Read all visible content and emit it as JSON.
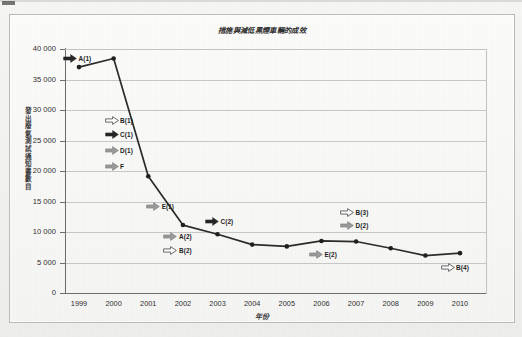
{
  "figure": {
    "title": "措施與減低黑煙車輛的成效",
    "x_axis_title": "年份",
    "y_axis_title": "發出廢氣測試通知書數目"
  },
  "chart_data": {
    "type": "line",
    "title": "措施與減低黑煙車輛的成效",
    "xlabel": "年份",
    "ylabel": "發出廢氣測試通知書數目",
    "xlim": [
      1999,
      2010
    ],
    "ylim": [
      0,
      40000
    ],
    "y_tick_step": 5000,
    "grid": true,
    "legend": "none",
    "categories": [
      "1999",
      "2000",
      "2001",
      "2002",
      "2003",
      "2004",
      "2005",
      "2006",
      "2007",
      "2008",
      "2009",
      "2010"
    ],
    "values": [
      37200,
      38600,
      19300,
      11300,
      9800,
      8100,
      7800,
      8700,
      8600,
      7500,
      6300,
      6700
    ],
    "y_tick_labels": [
      "0",
      "5 000",
      "10 000",
      "15 000",
      "20 000",
      "25 000",
      "30 000",
      "35 000",
      "40 000"
    ],
    "y_tick_values": [
      0,
      5000,
      10000,
      15000,
      20000,
      25000,
      30000,
      35000,
      40000
    ],
    "x_tick_labels": [
      "1999",
      "2000",
      "2001",
      "2002",
      "2003",
      "2004",
      "2005",
      "2006",
      "2007",
      "2008",
      "2009",
      "2010"
    ],
    "series_color": "#2b2b2b",
    "marker": "circle",
    "annotations": [
      {
        "label": "A(1)",
        "style": "black",
        "x_year": 1999.0,
        "y_value": 38500
      },
      {
        "label": "B(1)",
        "style": "outline",
        "x_year": 2000.2,
        "y_value": 28400
      },
      {
        "label": "C(1)",
        "style": "black",
        "x_year": 2000.2,
        "y_value": 26100
      },
      {
        "label": "D(1)",
        "style": "gray",
        "x_year": 2000.2,
        "y_value": 23400
      },
      {
        "label": "F",
        "style": "gray",
        "x_year": 2000.2,
        "y_value": 20800
      },
      {
        "label": "E(1)",
        "style": "gray",
        "x_year": 2001.4,
        "y_value": 14200
      },
      {
        "label": "A(2)",
        "style": "gray",
        "x_year": 2001.9,
        "y_value": 9300
      },
      {
        "label": "B(2)",
        "style": "outline",
        "x_year": 2001.9,
        "y_value": 7000
      },
      {
        "label": "C(2)",
        "style": "black",
        "x_year": 2003.1,
        "y_value": 11800
      },
      {
        "label": "B(3)",
        "style": "outline",
        "x_year": 2007.0,
        "y_value": 13300
      },
      {
        "label": "D(2)",
        "style": "gray",
        "x_year": 2007.0,
        "y_value": 11200
      },
      {
        "label": "E(2)",
        "style": "gray",
        "x_year": 2006.1,
        "y_value": 6400
      },
      {
        "label": "B(4)",
        "style": "outline",
        "x_year": 2009.9,
        "y_value": 4200
      }
    ]
  },
  "colors": {
    "line": "#2b2b2b",
    "grid": "#c6c6c4",
    "axis": "#6d6d6d",
    "arrow_black": "#262626",
    "arrow_gray": "#9a9a9a",
    "arrow_outline": "#fbfbfb",
    "arrow_stroke": "#5a5a5a",
    "plot_background": "#f8f8f7",
    "page_background": "#f3f3f1"
  }
}
